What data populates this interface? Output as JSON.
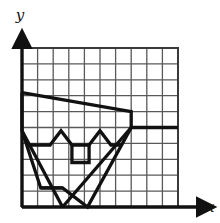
{
  "figure": {
    "background_color": "#ffffff",
    "grid_line_color": "#595959",
    "axis_color": "#111111",
    "shape_color": "#111111"
  },
  "axes": {
    "x_label": "x",
    "y_label": "y",
    "x_label_position": {
      "x": 206,
      "y": 212
    },
    "y_label_position": {
      "x": 20,
      "y": 20
    },
    "origin_px": {
      "x": 22,
      "y": 207
    },
    "x_axis_end_px": {
      "x": 205,
      "y": 207
    },
    "y_axis_end_px": {
      "x": 22,
      "y": 40
    },
    "arrowheads": [
      "x-axis-arrow",
      "y-axis-arrow"
    ]
  },
  "grid": {
    "columns": 10,
    "rows": 10,
    "cell_size_px": 15.6,
    "left_px": 22,
    "top_px": 48,
    "right_px": 178,
    "bottom_px": 207,
    "x_range": [
      0,
      10
    ],
    "y_range": [
      0,
      10
    ],
    "show_tick_labels": false,
    "line_width_px": 1.3
  },
  "chart_data": {
    "type": "line",
    "xlabel": "x",
    "ylabel": "y",
    "xlim": [
      0,
      10
    ],
    "ylim": [
      0,
      10
    ],
    "grid": true,
    "legend": null,
    "stroke_width_units": 0.22,
    "series": [
      {
        "name": "outer-outline",
        "closed": false,
        "points": [
          [
            0.0,
            7.2
          ],
          [
            7.0,
            6.0
          ],
          [
            7.0,
            5.0
          ],
          [
            4.2,
            0.0
          ],
          [
            2.6,
            1.2
          ],
          [
            1.2,
            1.2
          ],
          [
            0.0,
            4.8
          ],
          [
            0.0,
            7.2
          ]
        ]
      },
      {
        "name": "left-eye-chevron",
        "closed": false,
        "points": [
          [
            0.5,
            3.9
          ],
          [
            1.8,
            3.9
          ],
          [
            2.5,
            4.8
          ],
          [
            3.2,
            3.9
          ],
          [
            4.3,
            3.9
          ]
        ]
      },
      {
        "name": "right-eye-chevron",
        "closed": false,
        "points": [
          [
            4.3,
            3.9
          ],
          [
            5.0,
            4.8
          ],
          [
            5.7,
            3.9
          ],
          [
            6.4,
            3.9
          ]
        ]
      },
      {
        "name": "nose-box",
        "closed": false,
        "points": [
          [
            3.2,
            3.9
          ],
          [
            3.2,
            2.8
          ],
          [
            4.3,
            2.8
          ],
          [
            4.3,
            3.9
          ]
        ]
      },
      {
        "name": "chin-base",
        "closed": false,
        "points": [
          [
            1.2,
            1.2
          ],
          [
            2.6,
            1.2
          ]
        ]
      },
      {
        "name": "right-diagonal",
        "closed": false,
        "points": [
          [
            7.0,
            5.0
          ],
          [
            2.6,
            0.0
          ]
        ]
      },
      {
        "name": "left-diagonal",
        "closed": false,
        "points": [
          [
            0.0,
            4.8
          ],
          [
            2.6,
            0.0
          ]
        ]
      },
      {
        "name": "grid-row-highlight",
        "closed": false,
        "points": [
          [
            7.0,
            5.0
          ],
          [
            10.0,
            5.0
          ]
        ]
      }
    ]
  }
}
